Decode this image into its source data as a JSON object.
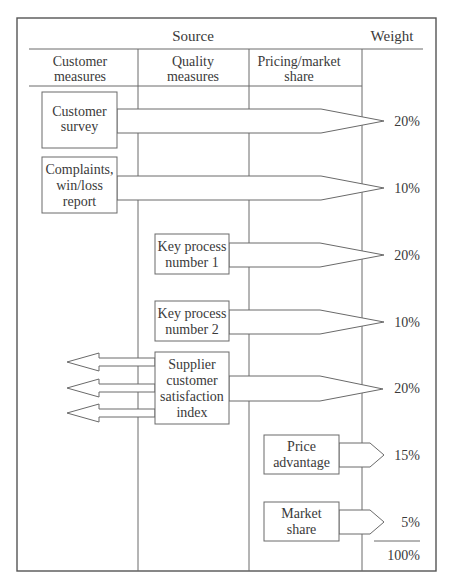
{
  "header": {
    "source_label": "Source",
    "weight_label": "Weight"
  },
  "columns": [
    {
      "line1": "Customer",
      "line2": "measures"
    },
    {
      "line1": "Quality",
      "line2": "measures"
    },
    {
      "line1": "Pricing/market",
      "line2": "share"
    }
  ],
  "measures": [
    {
      "id": "customer-survey",
      "lines": [
        "Customer",
        "survey"
      ],
      "column": "Customer measures",
      "weight": "20%"
    },
    {
      "id": "complaints",
      "lines": [
        "Complaints,",
        "win/loss",
        "report"
      ],
      "column": "Customer measures",
      "weight": "10%"
    },
    {
      "id": "key-process-1",
      "lines": [
        "Key process",
        "number 1"
      ],
      "column": "Quality measures",
      "weight": "20%"
    },
    {
      "id": "key-process-2",
      "lines": [
        "Key process",
        "number 2"
      ],
      "column": "Quality measures",
      "weight": "10%"
    },
    {
      "id": "supplier-index",
      "lines": [
        "Supplier",
        "customer",
        "satisfaction",
        "index"
      ],
      "column": "Quality measures",
      "weight": "20%"
    },
    {
      "id": "price-advantage",
      "lines": [
        "Price",
        "advantage"
      ],
      "column": "Pricing/market share",
      "weight": "15%"
    },
    {
      "id": "market-share",
      "lines": [
        "Market",
        "share"
      ],
      "column": "Pricing/market share",
      "weight": "5%"
    }
  ],
  "total": "100%",
  "colors": {
    "line": "#6a6a6a",
    "frame": "#555555",
    "text": "#3a3a3a",
    "background": "#ffffff"
  }
}
